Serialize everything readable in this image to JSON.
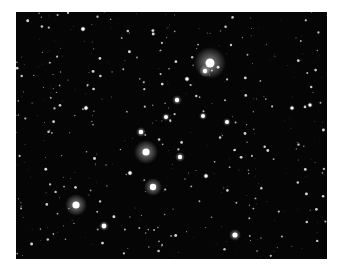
{
  "image": {
    "subject": "star cluster photograph",
    "background_color": "#050505",
    "frame": {
      "x": 16,
      "y": 12,
      "width": 311,
      "height": 247
    },
    "bright_stars": [
      {
        "x": 210,
        "y": 63,
        "r": 4.5,
        "glow": 16
      },
      {
        "x": 205,
        "y": 71,
        "r": 2.2,
        "glow": 6
      },
      {
        "x": 146,
        "y": 152,
        "r": 3.6,
        "glow": 12
      },
      {
        "x": 153,
        "y": 187,
        "r": 3.2,
        "glow": 9
      },
      {
        "x": 76,
        "y": 205,
        "r": 3.6,
        "glow": 11
      },
      {
        "x": 235,
        "y": 235,
        "r": 2.6,
        "glow": 6
      },
      {
        "x": 104,
        "y": 226,
        "r": 2.4,
        "glow": 5
      },
      {
        "x": 141,
        "y": 132,
        "r": 2.3,
        "glow": 5
      },
      {
        "x": 177,
        "y": 100,
        "r": 2.2,
        "glow": 5
      },
      {
        "x": 180,
        "y": 157,
        "r": 2.2,
        "glow": 5
      },
      {
        "x": 166,
        "y": 117,
        "r": 2.0,
        "glow": 4
      },
      {
        "x": 203,
        "y": 116,
        "r": 2.0,
        "glow": 4
      },
      {
        "x": 227,
        "y": 122,
        "r": 2.0,
        "glow": 4
      },
      {
        "x": 83,
        "y": 29,
        "r": 1.8,
        "glow": 3
      },
      {
        "x": 86,
        "y": 108,
        "r": 1.7,
        "glow": 3
      },
      {
        "x": 130,
        "y": 173,
        "r": 1.7,
        "glow": 3
      },
      {
        "x": 206,
        "y": 176,
        "r": 1.7,
        "glow": 3
      },
      {
        "x": 187,
        "y": 79,
        "r": 1.7,
        "glow": 3
      },
      {
        "x": 310,
        "y": 105,
        "r": 1.6,
        "glow": 3
      },
      {
        "x": 292,
        "y": 108,
        "r": 1.6,
        "glow": 3
      }
    ]
  }
}
